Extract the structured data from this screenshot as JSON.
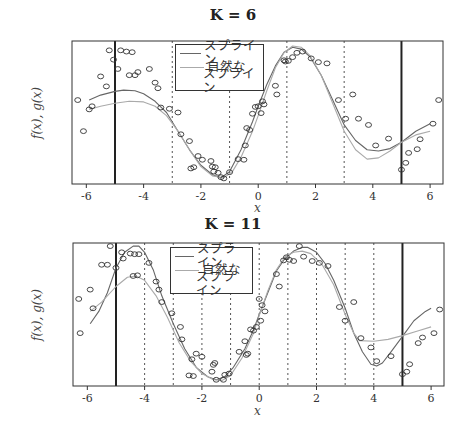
{
  "chart_data": [
    {
      "type": "line",
      "title": "K = 6",
      "xlabel": "x",
      "ylabel": "f(x), g(x)",
      "xlim": [
        -6.5,
        6.45
      ],
      "ylim": [
        -1.15,
        1.15
      ],
      "x_ticks": [
        -6,
        -4,
        -2,
        0,
        2,
        4,
        6
      ],
      "x_tick_labels": [
        "-6",
        "-4",
        "-2",
        "0",
        "2",
        "4",
        "6"
      ],
      "boundary_lines": [
        -5,
        5
      ],
      "knots": [
        -3,
        -1,
        1,
        3
      ],
      "legend": {
        "position": "top-center",
        "entries": [
          "スプライン",
          "自然なスプライン"
        ]
      },
      "series": [
        {
          "name": "スプライン",
          "color": "#666666",
          "x": [
            -5.9,
            -5.5,
            -5,
            -4.7,
            -4.3,
            -4,
            -3.6,
            -3.2,
            -2.8,
            -2.4,
            -2,
            -1.6,
            -1.3,
            -1.0,
            -0.6,
            -0.2,
            0,
            0.3,
            0.6,
            0.9,
            1.2,
            1.5,
            1.8,
            2.2,
            2.6,
            3.0,
            3.4,
            3.8,
            4.2,
            4.6,
            5.0,
            5.5,
            6.0
          ],
          "y": [
            0.2,
            0.28,
            0.34,
            0.36,
            0.35,
            0.3,
            0.18,
            0.0,
            -0.3,
            -0.6,
            -0.85,
            -1.0,
            -1.05,
            -0.95,
            -0.6,
            -0.15,
            0.1,
            0.45,
            0.75,
            0.97,
            1.05,
            1.02,
            0.9,
            0.6,
            0.2,
            -0.2,
            -0.45,
            -0.6,
            -0.62,
            -0.58,
            -0.48,
            -0.3,
            -0.18
          ]
        },
        {
          "name": "自然なスプライン",
          "color": "#aaaaaa",
          "x": [
            -5.9,
            -5.5,
            -5,
            -4.5,
            -4,
            -3.6,
            -3.2,
            -2.8,
            -2.4,
            -2,
            -1.6,
            -1.2,
            -0.9,
            -0.6,
            -0.2,
            0,
            0.3,
            0.6,
            0.9,
            1.2,
            1.5,
            1.8,
            2.2,
            2.6,
            3.0,
            3.4,
            3.8,
            4.2,
            4.6,
            5.0,
            5.5,
            6.0
          ],
          "y": [
            0.05,
            0.1,
            0.15,
            0.18,
            0.17,
            0.1,
            -0.05,
            -0.3,
            -0.6,
            -0.87,
            -1.02,
            -1.05,
            -0.95,
            -0.72,
            -0.3,
            -0.05,
            0.35,
            0.72,
            0.96,
            1.07,
            1.05,
            0.92,
            0.6,
            0.15,
            -0.3,
            -0.6,
            -0.75,
            -0.73,
            -0.62,
            -0.48,
            -0.36,
            -0.3
          ]
        }
      ],
      "points": {
        "x": [
          -6.3,
          -6.1,
          -5.9,
          -5.8,
          -5.5,
          -5.3,
          -5.2,
          -5.05,
          -4.9,
          -4.8,
          -4.6,
          -4.5,
          -4.4,
          -4.3,
          -4.2,
          -3.8,
          -3.6,
          -3.5,
          -3.4,
          -3.1,
          -2.8,
          -2.7,
          -2.4,
          -2.35,
          -2.25,
          -2.1,
          -1.95,
          -1.65,
          -1.6,
          -1.55,
          -1.5,
          -1.4,
          -1.3,
          -1.2,
          -1.0,
          -0.7,
          -0.5,
          -0.45,
          -0.4,
          -0.3,
          -0.2,
          -0.1,
          0,
          0.1,
          0.15,
          0.2,
          0.6,
          0.65,
          0.9,
          0.95,
          1.05,
          1.2,
          1.35,
          1.55,
          1.85,
          2.1,
          2.4,
          2.8,
          3.05,
          3.3,
          3.5,
          3.85,
          4.1,
          4.55,
          5.0,
          5.15,
          5.25,
          5.55,
          5.65,
          6.1,
          6.3
        ],
        "y": [
          0.2,
          -0.3,
          0.05,
          0.1,
          0.58,
          0.42,
          1.0,
          0.85,
          0.7,
          1.0,
          0.98,
          0.6,
          0.97,
          0.6,
          0.65,
          0.7,
          0.48,
          0.39,
          0.08,
          0.06,
          0.0,
          -0.35,
          -0.46,
          -0.9,
          -0.88,
          -0.7,
          -0.76,
          -0.78,
          -0.87,
          -0.95,
          -0.88,
          -0.97,
          -1.04,
          -1.06,
          -0.96,
          -0.75,
          -0.76,
          -0.53,
          -0.25,
          -0.28,
          -0.02,
          0.09,
          0.1,
          -0.01,
          0.18,
          0.13,
          0.43,
          0.29,
          0.84,
          0.82,
          0.83,
          0.89,
          0.96,
          0.98,
          0.87,
          0.81,
          0.79,
          0.2,
          -0.1,
          0.29,
          -0.1,
          -0.2,
          -0.53,
          -0.42,
          -0.92,
          -0.81,
          -0.65,
          -0.59,
          -0.43,
          -0.18,
          0.2
        ]
      }
    },
    {
      "type": "line",
      "title": "K = 11",
      "xlabel": "x",
      "ylabel": "f(x), g(x)",
      "xlim": [
        -6.5,
        6.45
      ],
      "ylim": [
        -1.15,
        1.15
      ],
      "x_ticks": [
        -6,
        -4,
        -2,
        0,
        2,
        4,
        6
      ],
      "x_tick_labels": [
        "-6",
        "-4",
        "-2",
        "0",
        "2",
        "4",
        "6"
      ],
      "boundary_lines": [
        -5,
        5
      ],
      "knots": [
        -4,
        -3,
        -2,
        -1,
        0,
        1,
        2,
        3,
        4
      ],
      "legend": {
        "position": "top-center",
        "entries": [
          "スプライン",
          "自然なスプライン"
        ]
      },
      "series": [
        {
          "name": "スプライン",
          "color": "#666666",
          "x": [
            -5.9,
            -5.6,
            -5.3,
            -5,
            -4.7,
            -4.4,
            -4.2,
            -4,
            -3.7,
            -3.4,
            -3,
            -2.6,
            -2.2,
            -1.8,
            -1.5,
            -1.2,
            -0.9,
            -0.5,
            -0.2,
            0,
            0.3,
            0.6,
            0.9,
            1.2,
            1.5,
            1.7,
            2.0,
            2.3,
            2.6,
            3.0,
            3.3,
            3.6,
            3.9,
            4.1,
            4.3,
            4.6,
            5.0,
            5.4,
            5.8,
            6.0
          ],
          "y": [
            -0.15,
            0.05,
            0.35,
            0.75,
            1.0,
            1.1,
            1.1,
            1.0,
            0.72,
            0.3,
            -0.15,
            -0.55,
            -0.85,
            -1.0,
            -1.05,
            -1.0,
            -0.85,
            -0.55,
            -0.25,
            0.0,
            0.35,
            0.7,
            0.9,
            1.02,
            1.08,
            1.08,
            1.0,
            0.82,
            0.55,
            0.1,
            -0.3,
            -0.6,
            -0.8,
            -0.83,
            -0.78,
            -0.6,
            -0.35,
            -0.1,
            0.05,
            0.1
          ]
        },
        {
          "name": "自然なスプライン",
          "color": "#aaaaaa",
          "x": [
            -5.9,
            -5.5,
            -5,
            -4.6,
            -4.3,
            -4,
            -3.6,
            -3.2,
            -2.8,
            -2.4,
            -2,
            -1.6,
            -1.3,
            -1.0,
            -0.6,
            -0.2,
            0,
            0.3,
            0.6,
            0.9,
            1.2,
            1.5,
            1.8,
            2.2,
            2.6,
            3.0,
            3.3,
            3.5,
            4.0,
            4.5,
            5.0,
            5.5,
            6.0
          ],
          "y": [
            0.05,
            0.2,
            0.45,
            0.6,
            0.62,
            0.55,
            0.3,
            -0.05,
            -0.45,
            -0.75,
            -0.95,
            -1.05,
            -1.06,
            -0.98,
            -0.7,
            -0.3,
            -0.02,
            0.38,
            0.72,
            0.93,
            1.0,
            1.02,
            0.98,
            0.8,
            0.48,
            0.0,
            -0.3,
            -0.42,
            -0.43,
            -0.4,
            -0.34,
            -0.27,
            -0.2
          ]
        }
      ],
      "points": {
        "x": [
          -6.3,
          -6.25,
          -5.9,
          -5.8,
          -5.5,
          -5.3,
          -5.2,
          -5.0,
          -4.8,
          -4.75,
          -4.5,
          -4.4,
          -4.35,
          -4.25,
          -4.2,
          -3.85,
          -3.6,
          -3.5,
          -3.4,
          -3.05,
          -2.75,
          -2.7,
          -2.45,
          -2.35,
          -2.3,
          -2.2,
          -2.0,
          -1.65,
          -1.6,
          -1.55,
          -1.5,
          -1.25,
          -1.2,
          -1.05,
          -0.7,
          -0.5,
          -0.45,
          -0.4,
          -0.3,
          -0.2,
          -0.1,
          0,
          0.05,
          0.1,
          0.2,
          0.6,
          0.7,
          0.85,
          0.95,
          1.05,
          1.2,
          1.4,
          1.55,
          1.85,
          2.1,
          2.4,
          2.8,
          3.0,
          3.3,
          3.55,
          3.9,
          4.1,
          4.6,
          5.0,
          5.15,
          5.25,
          5.55,
          5.7,
          6.1,
          6.3
        ],
        "y": [
          0.25,
          -0.3,
          0.4,
          0.1,
          0.8,
          0.8,
          1.1,
          0.75,
          1.0,
          0.9,
          0.98,
          0.62,
          0.97,
          0.63,
          0.97,
          0.83,
          0.53,
          0.4,
          0.2,
          0.02,
          -0.2,
          -0.4,
          -0.98,
          -0.72,
          -0.99,
          -0.63,
          -0.68,
          -0.92,
          -0.81,
          -0.78,
          -1.05,
          -1.05,
          -0.97,
          -0.95,
          -0.6,
          -0.43,
          -0.65,
          -0.63,
          -0.24,
          -0.26,
          -0.2,
          0.25,
          -0.1,
          0.15,
          0.05,
          0.65,
          0.45,
          0.87,
          0.92,
          0.88,
          0.86,
          1.1,
          0.93,
          0.86,
          0.83,
          0.78,
          0.12,
          -0.1,
          0.2,
          -0.38,
          -0.53,
          -0.75,
          -0.67,
          -0.96,
          -0.92,
          -0.8,
          -0.46,
          -0.37,
          -0.3,
          0.08
        ]
      }
    }
  ],
  "panels": [
    {
      "title": "K = 6",
      "ylabel": "f(x), g(x)",
      "xlabel": "x",
      "legend": [
        "スプライン",
        "自然な",
        "スプライン"
      ]
    },
    {
      "title": "K = 11",
      "ylabel": "f(x), g(x)",
      "xlabel": "x",
      "legend": [
        "スプライン",
        "自然な",
        "スプライン"
      ]
    }
  ]
}
